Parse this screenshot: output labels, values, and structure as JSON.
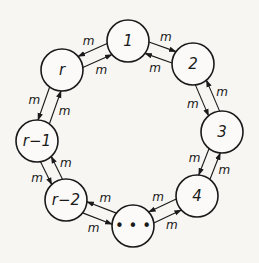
{
  "diagram": {
    "colors": {
      "ink": "#1a1a1a",
      "paper": "#f7f6f3",
      "node_fill": "#fbfaf8"
    },
    "node_radius": 21,
    "nodes": [
      {
        "id": "1",
        "label": "1",
        "x": 128,
        "y": 41
      },
      {
        "id": "2",
        "label": "2",
        "x": 193,
        "y": 64
      },
      {
        "id": "3",
        "label": "3",
        "x": 222,
        "y": 132
      },
      {
        "id": "4",
        "label": "4",
        "x": 197,
        "y": 196
      },
      {
        "id": "dots",
        "label": "• • •",
        "x": 133,
        "y": 226
      },
      {
        "id": "r-2",
        "label": "r−2",
        "x": 66,
        "y": 200
      },
      {
        "id": "r-1",
        "label": "r−1",
        "x": 37,
        "y": 141
      },
      {
        "id": "r",
        "label": "r",
        "x": 62,
        "y": 70
      }
    ],
    "edges": [
      {
        "from": "1",
        "to": "2",
        "label": "m",
        "side": "outer"
      },
      {
        "from": "2",
        "to": "1",
        "label": "m",
        "side": "inner"
      },
      {
        "from": "2",
        "to": "3",
        "label": "m",
        "side": "inner"
      },
      {
        "from": "3",
        "to": "2",
        "label": "m",
        "side": "outer"
      },
      {
        "from": "3",
        "to": "4",
        "label": "m",
        "side": "inner"
      },
      {
        "from": "4",
        "to": "3",
        "label": "m",
        "side": "outer"
      },
      {
        "from": "4",
        "to": "dots",
        "label": "m",
        "side": "inner"
      },
      {
        "from": "dots",
        "to": "4",
        "label": "m",
        "side": "outer"
      },
      {
        "from": "dots",
        "to": "r-2",
        "label": "m",
        "side": "inner"
      },
      {
        "from": "r-2",
        "to": "dots",
        "label": "m",
        "side": "outer"
      },
      {
        "from": "r-2",
        "to": "r-1",
        "label": "m",
        "side": "inner"
      },
      {
        "from": "r-1",
        "to": "r-2",
        "label": "m",
        "side": "outer"
      },
      {
        "from": "r-1",
        "to": "r",
        "label": "m",
        "side": "inner"
      },
      {
        "from": "r",
        "to": "r-1",
        "label": "m",
        "side": "outer"
      },
      {
        "from": "r",
        "to": "1",
        "label": "m",
        "side": "inner"
      },
      {
        "from": "1",
        "to": "r",
        "label": "m",
        "side": "outer"
      }
    ]
  }
}
